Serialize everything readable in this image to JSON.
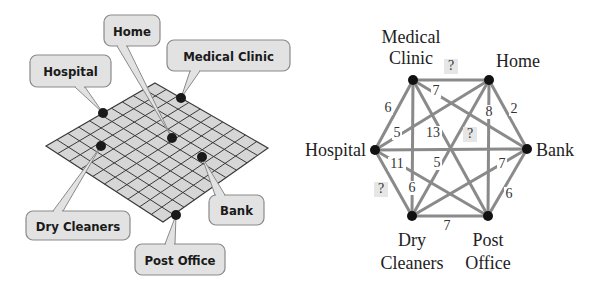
{
  "map": {
    "grid": {
      "corners": {
        "top": [
          155,
          83
        ],
        "right": [
          268,
          148
        ],
        "bottom": [
          163,
          222
        ],
        "left": [
          46,
          146
        ]
      },
      "divisions": 10,
      "fill": "#d6d6d6",
      "line": "#3a3a3a"
    },
    "locations": [
      {
        "id": "hospital",
        "label": "Hospital",
        "point": [
          103,
          113
        ],
        "box": [
          30,
          55,
          81,
          32
        ],
        "tail": [
          80,
          87
        ]
      },
      {
        "id": "home",
        "label": "Home",
        "point": [
          172,
          138
        ],
        "box": [
          104,
          15,
          56,
          31
        ],
        "tail": [
          122,
          46
        ]
      },
      {
        "id": "medical",
        "label": "Medical Clinic",
        "point": [
          181,
          98
        ],
        "box": [
          167,
          40,
          123,
          31
        ],
        "tail": [
          195,
          71
        ]
      },
      {
        "id": "drycleaners",
        "label": "Dry Cleaners",
        "point": [
          101,
          146
        ],
        "box": [
          26,
          211,
          104,
          29
        ],
        "tail": [
          58,
          211
        ]
      },
      {
        "id": "bank",
        "label": "Bank",
        "point": [
          202,
          157
        ],
        "box": [
          209,
          195,
          55,
          30
        ],
        "tail": [
          220,
          195
        ]
      },
      {
        "id": "postoffice",
        "label": "Post Office",
        "point": [
          176,
          215
        ],
        "box": [
          135,
          244,
          90,
          31
        ],
        "tail": [
          170,
          244
        ]
      }
    ]
  },
  "graph": {
    "nodes": [
      {
        "id": "medical",
        "label_lines": [
          "Medical",
          "Clinic"
        ],
        "x": 413,
        "y": 80,
        "lx": 411,
        "ly": [
          43,
          64
        ],
        "anchor": "middle"
      },
      {
        "id": "home",
        "label_lines": [
          "Home"
        ],
        "x": 489,
        "y": 80,
        "lx": 518,
        "ly": [
          67
        ],
        "anchor": "middle"
      },
      {
        "id": "hospital",
        "label_lines": [
          "Hospital"
        ],
        "x": 375,
        "y": 150,
        "lx": 366,
        "ly": [
          156
        ],
        "anchor": "end"
      },
      {
        "id": "bank",
        "label_lines": [
          "Bank"
        ],
        "x": 527,
        "y": 149,
        "lx": 536,
        "ly": [
          156
        ],
        "anchor": "start"
      },
      {
        "id": "drycleaners",
        "label_lines": [
          "Dry",
          "Cleaners"
        ],
        "x": 412,
        "y": 216,
        "lx": 412,
        "ly": [
          246,
          269
        ],
        "anchor": "middle"
      },
      {
        "id": "postoffice",
        "label_lines": [
          "Post",
          "Office"
        ],
        "x": 488,
        "y": 216,
        "lx": 488,
        "ly": [
          246,
          269
        ],
        "anchor": "middle"
      }
    ],
    "edges": [
      {
        "from": "medical",
        "to": "home",
        "weight": "?",
        "lx": 451,
        "ly": 70,
        "unknown": true
      },
      {
        "from": "medical",
        "to": "hospital",
        "weight": "6",
        "lx": 388,
        "ly": 112
      },
      {
        "from": "medical",
        "to": "bank",
        "weight": "7",
        "lx": 436,
        "ly": 95
      },
      {
        "from": "medical",
        "to": "drycleaners",
        "weight": "6",
        "lx": 412,
        "ly": 192
      },
      {
        "from": "medical",
        "to": "postoffice",
        "weight": "13",
        "lx": 433,
        "ly": 137
      },
      {
        "from": "home",
        "to": "bank",
        "weight": "2",
        "lx": 514,
        "ly": 113
      },
      {
        "from": "home",
        "to": "postoffice",
        "weight": "8",
        "lx": 489,
        "ly": 116
      },
      {
        "from": "home",
        "to": "hospital",
        "weight": "5",
        "lx": 397,
        "ly": 137
      },
      {
        "from": "home",
        "to": "drycleaners",
        "weight": "5",
        "lx": 437,
        "ly": 167
      },
      {
        "from": "hospital",
        "to": "bank",
        "weight": "?",
        "lx": 470,
        "ly": 138,
        "unknown": true
      },
      {
        "from": "hospital",
        "to": "postoffice",
        "weight": "11",
        "lx": 397,
        "ly": 168
      },
      {
        "from": "hospital",
        "to": "drycleaners",
        "weight": "?",
        "lx": 381,
        "ly": 193,
        "unknown": true
      },
      {
        "from": "bank",
        "to": "drycleaners",
        "weight": "7",
        "lx": 502,
        "ly": 168
      },
      {
        "from": "bank",
        "to": "postoffice",
        "weight": "6",
        "lx": 509,
        "ly": 198
      },
      {
        "from": "drycleaners",
        "to": "postoffice",
        "weight": "7",
        "lx": 447,
        "ly": 230
      }
    ],
    "colors": {
      "edge": "#8a8a8a",
      "node": "#111111",
      "unknown_bg": "#e6e6e6"
    }
  }
}
